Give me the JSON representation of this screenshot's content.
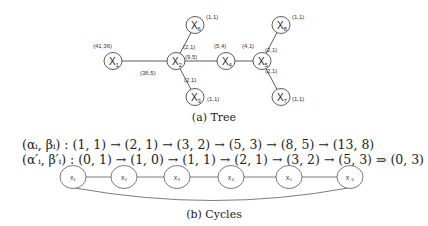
{
  "tree": {
    "caption": "(a) Tree",
    "nodes": [
      {
        "id": "X1",
        "name": "X",
        "sub": "1",
        "x": 113,
        "y": 61,
        "weight": "(41,36)",
        "wx": 93,
        "wy": 48
      },
      {
        "id": "X2",
        "name": "X",
        "sub": "2",
        "x": 176,
        "y": 61,
        "weight": "",
        "wx": 0,
        "wy": 0
      },
      {
        "id": "X6",
        "name": "X",
        "sub": "6",
        "x": 195,
        "y": 25,
        "weight": "(1,1)",
        "wx": 206,
        "wy": 19
      },
      {
        "id": "X3",
        "name": "X",
        "sub": "3",
        "x": 195,
        "y": 97,
        "weight": "(1,1)",
        "wx": 207,
        "wy": 101
      },
      {
        "id": "X4",
        "name": "X",
        "sub": "4",
        "x": 226,
        "y": 61,
        "weight": "(5,4)",
        "wx": 214,
        "wy": 48
      },
      {
        "id": "X5",
        "name": "X",
        "sub": "5",
        "x": 262,
        "y": 61,
        "weight": "(4,1)",
        "wx": 242,
        "wy": 48
      },
      {
        "id": "X8",
        "name": "X",
        "sub": "8",
        "x": 281,
        "y": 25,
        "weight": "(1,1)",
        "wx": 292,
        "wy": 19
      },
      {
        "id": "X7",
        "name": "X",
        "sub": "7",
        "x": 281,
        "y": 97,
        "weight": "(1,1)",
        "wx": 292,
        "wy": 101
      }
    ],
    "edge_labels": [
      {
        "text": "(36,5)",
        "x": 140,
        "y": 75
      },
      {
        "text": "(2,1)",
        "x": 183,
        "y": 49
      },
      {
        "text": "(9,5)",
        "x": 185,
        "y": 59
      },
      {
        "text": "(2,1)",
        "x": 184,
        "y": 82
      },
      {
        "text": "(2,1)",
        "x": 265,
        "y": 52
      },
      {
        "text": "(2,1)",
        "x": 265,
        "y": 73
      }
    ]
  },
  "cycles": {
    "caption": "(b) Cycles",
    "row1": "(αᵢ, βᵢ) : (1, 1)  → (2, 1)  →  (3, 2)  →  (5, 3)  →  (8, 5)  →  (13, 8)",
    "row2": "(α′ᵢ, β′ᵢ) : (0, 1)  → (1, 0)  →  (1, 1)  →  (2, 1)  →  (3, 2)  →  (5, 3) ⇒ (0, 3)",
    "nodes": [
      {
        "label": "x₁",
        "x": 73
      },
      {
        "label": "x₂",
        "x": 124
      },
      {
        "label": "x₃",
        "x": 177
      },
      {
        "label": "x₄",
        "x": 231
      },
      {
        "label": "x₅",
        "x": 289
      },
      {
        "label": "x ₆",
        "x": 350
      }
    ]
  }
}
